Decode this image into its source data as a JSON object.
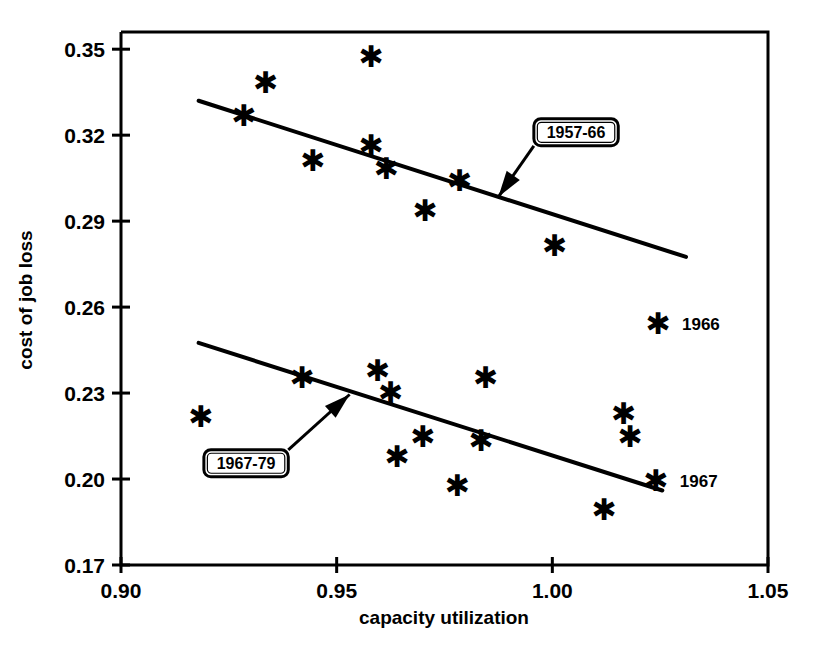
{
  "chart_data": {
    "type": "scatter",
    "title": "",
    "xlabel": "capacity utilization",
    "ylabel": "cost of job loss",
    "xlim": [
      0.9,
      1.05
    ],
    "ylim": [
      0.17,
      0.356
    ],
    "grid": false,
    "legend": "inline-callouts",
    "xticks": [
      "0.90",
      "0.95",
      "1.00",
      "1.05"
    ],
    "xtick_values": [
      0.9,
      0.95,
      1.0,
      1.05
    ],
    "yticks": [
      "0.17",
      "0.20",
      "0.23",
      "0.26",
      "0.29",
      "0.32",
      "0.35"
    ],
    "ytick_values": [
      0.17,
      0.2,
      0.23,
      0.26,
      0.29,
      0.32,
      0.35
    ],
    "marker": "asterisk",
    "series": [
      {
        "name": "1957-66",
        "callout_label": "1957-66",
        "points": [
          {
            "x": 0.9285,
            "y": 0.327
          },
          {
            "x": 0.9335,
            "y": 0.3385
          },
          {
            "x": 0.9445,
            "y": 0.3115
          },
          {
            "x": 0.958,
            "y": 0.3475
          },
          {
            "x": 0.958,
            "y": 0.3165
          },
          {
            "x": 0.9615,
            "y": 0.3085
          },
          {
            "x": 0.9705,
            "y": 0.294
          },
          {
            "x": 0.9785,
            "y": 0.3045
          },
          {
            "x": 1.0005,
            "y": 0.2815
          },
          {
            "x": 1.0245,
            "y": 0.2545
          }
        ],
        "fit_line": {
          "x1": 0.918,
          "y1": 0.332,
          "x2": 1.031,
          "y2": 0.2775
        },
        "endpoint_label": "1966",
        "endpoint_label_point": {
          "x": 1.0245,
          "y": 0.2545
        }
      },
      {
        "name": "1967-79",
        "callout_label": "1967-79",
        "points": [
          {
            "x": 0.9185,
            "y": 0.222
          },
          {
            "x": 0.942,
            "y": 0.2355
          },
          {
            "x": 0.9595,
            "y": 0.238
          },
          {
            "x": 0.9625,
            "y": 0.2305
          },
          {
            "x": 0.964,
            "y": 0.208
          },
          {
            "x": 0.97,
            "y": 0.215
          },
          {
            "x": 0.978,
            "y": 0.198
          },
          {
            "x": 0.9835,
            "y": 0.2135
          },
          {
            "x": 0.9845,
            "y": 0.2355
          },
          {
            "x": 1.012,
            "y": 0.1895
          },
          {
            "x": 1.0165,
            "y": 0.223
          },
          {
            "x": 1.018,
            "y": 0.215
          },
          {
            "x": 1.024,
            "y": 0.1995
          }
        ],
        "fit_line": {
          "x1": 0.918,
          "y1": 0.2475,
          "x2": 1.0255,
          "y2": 0.196
        },
        "endpoint_label": "1967",
        "endpoint_label_point": {
          "x": 1.024,
          "y": 0.1995
        }
      }
    ],
    "annotations": [
      {
        "id": "callout-1957-66",
        "text": "1957-66",
        "box_x": 1.0055,
        "box_y": 0.321,
        "arrow_to_x": 0.9875,
        "arrow_to_y": 0.2985
      },
      {
        "id": "callout-1967-79",
        "text": "1967-79",
        "box_x": 0.929,
        "box_y": 0.2055,
        "arrow_to_x": 0.953,
        "arrow_to_y": 0.2295
      }
    ]
  }
}
